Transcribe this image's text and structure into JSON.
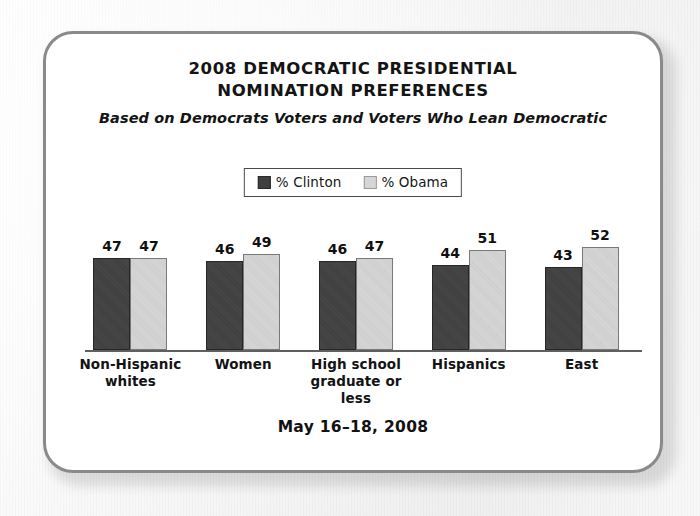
{
  "card": {
    "border_color": "#8a8a8a",
    "background": "#ffffff"
  },
  "header": {
    "title_line1": "2008 DEMOCRATIC PRESIDENTIAL",
    "title_line2": "NOMINATION PREFERENCES",
    "subtitle": "Based on Democrats Voters and Voters Who Lean Democratic"
  },
  "legend": {
    "items": [
      {
        "label": "% Clinton",
        "color": "#3f3f3f",
        "swatch_name": "legend-swatch-clinton"
      },
      {
        "label": "% Obama",
        "color": "#d6d6d6",
        "swatch_name": "legend-swatch-obama"
      }
    ]
  },
  "footer": {
    "date": "May 16–18, 2008"
  },
  "chart_data": {
    "type": "bar",
    "title": "2008 DEMOCRATIC PRESIDENTIAL NOMINATION PREFERENCES",
    "subtitle": "Based on Democrats Voters and Voters Who Lean Democratic",
    "xlabel": "",
    "ylabel": "",
    "ylim": [
      5,
      60
    ],
    "grid": false,
    "legend_position": "top-center",
    "categories": [
      "Non-Hispanic whites",
      "Women",
      "High school graduate or less",
      "Hispanics",
      "East"
    ],
    "category_lines": [
      [
        "Non-Hispanic",
        "whites"
      ],
      [
        "Women"
      ],
      [
        "High school",
        "graduate or less"
      ],
      [
        "Hispanics"
      ],
      [
        "East"
      ]
    ],
    "series": [
      {
        "name": "% Clinton",
        "color": "#3f3f3f",
        "values": [
          47,
          46,
          46,
          44,
          43
        ]
      },
      {
        "name": "% Obama",
        "color": "#d6d6d6",
        "values": [
          47,
          49,
          47,
          51,
          52
        ]
      }
    ],
    "note": "May 16–18, 2008"
  }
}
